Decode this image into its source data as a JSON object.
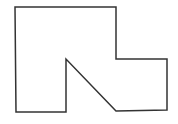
{
  "diagram": {
    "type": "polygon-outline",
    "stroke_color": "#333333",
    "fill_color": "#ffffff",
    "background_color": "#ffffff",
    "stroke_width": 1.5,
    "points": "15,7 116,7 116,59 167,59 167,110 116,111 66,59 66,112 16,112"
  }
}
